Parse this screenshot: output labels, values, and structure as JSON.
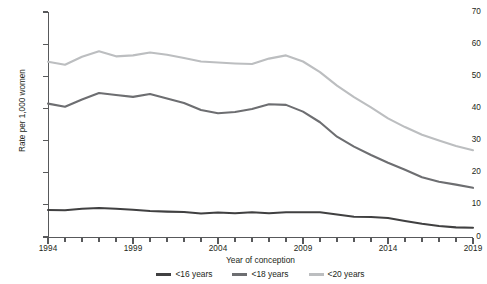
{
  "chart_data": {
    "type": "line",
    "title": "",
    "xlabel": "Year of conception",
    "ylabel": "Rate per 1,000 women",
    "xlim": [
      1994,
      2019
    ],
    "ylim": [
      0,
      70
    ],
    "ytick_step": 10,
    "yticks": [
      0,
      10,
      20,
      30,
      40,
      50,
      60,
      70
    ],
    "ytick_labels": [
      "0",
      "10",
      "20",
      "30",
      "40",
      "50",
      "60",
      "70"
    ],
    "xticks_major": [
      1994,
      1999,
      2004,
      2009,
      2014,
      2019
    ],
    "xtick_labels": [
      "1994",
      "1999",
      "2004",
      "2009",
      "2014",
      "2019"
    ],
    "xticks_minor_every": 1,
    "grid": false,
    "legend_position": "bottom-center",
    "x": [
      1994,
      1995,
      1996,
      1997,
      1998,
      1999,
      2000,
      2001,
      2002,
      2003,
      2004,
      2005,
      2006,
      2007,
      2008,
      2009,
      2010,
      2011,
      2012,
      2013,
      2014,
      2015,
      2016,
      2017,
      2018,
      2019
    ],
    "series": [
      {
        "name": "<16 years",
        "color": "#404041",
        "values": [
          8.4,
          8.3,
          8.8,
          9.0,
          8.8,
          8.5,
          8.1,
          7.9,
          7.8,
          7.3,
          7.6,
          7.4,
          7.7,
          7.4,
          7.7,
          7.7,
          7.7,
          7.0,
          6.3,
          6.2,
          5.9,
          5.0,
          4.1,
          3.4,
          3.0,
          2.9
        ]
      },
      {
        "name": "<18 years",
        "color": "#6d6e71",
        "values": [
          41.5,
          40.5,
          42.8,
          44.8,
          44.2,
          43.6,
          44.5,
          43.1,
          41.7,
          39.5,
          38.5,
          38.9,
          39.8,
          41.3,
          41.1,
          39.0,
          35.7,
          31.2,
          28.1,
          25.5,
          23.1,
          20.9,
          18.6,
          17.2,
          16.3,
          15.3
        ]
      },
      {
        "name": "<20 years",
        "color": "#bcbec0",
        "values": [
          54.5,
          53.6,
          56.1,
          57.8,
          56.2,
          56.5,
          57.4,
          56.7,
          55.7,
          54.6,
          54.3,
          54.0,
          53.8,
          55.5,
          56.5,
          54.6,
          51.3,
          47.1,
          43.5,
          40.3,
          36.9,
          34.2,
          31.8,
          30.0,
          28.3,
          27.0
        ]
      }
    ]
  },
  "legend": {
    "items": [
      {
        "label": "<16 years",
        "color": "#404041"
      },
      {
        "label": "<18 years",
        "color": "#6d6e71"
      },
      {
        "label": "<20 years",
        "color": "#bcbec0"
      }
    ]
  }
}
